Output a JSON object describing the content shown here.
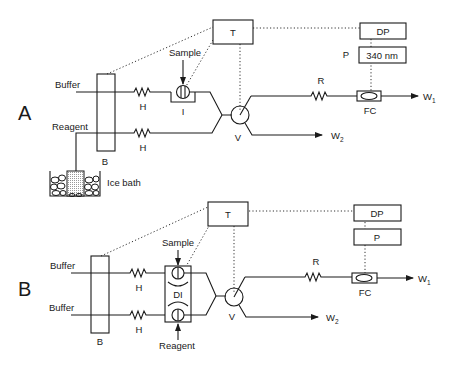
{
  "diagram": {
    "type": "flow-injection-analysis-schematic",
    "panels": [
      {
        "id": "A",
        "label": "A",
        "inputs": [
          "Buffer",
          "Reagent"
        ],
        "bath_label": "B",
        "heating_coil_label": "H",
        "injector_label": "I",
        "injection_label": "Sample",
        "cooling_label": "Ice bath",
        "controller_label": "T",
        "valve_label": "V",
        "reactor_label": "R",
        "flow_cell_label": "FC",
        "detector_label": "DP",
        "photometer_label": "P",
        "wavelength": "340 nm",
        "waste1": {
          "main": "W",
          "sub": "1"
        },
        "waste2": {
          "main": "W",
          "sub": "2"
        }
      },
      {
        "id": "B",
        "label": "B",
        "inputs": [
          "Buffer",
          "Buffer"
        ],
        "bath_label": "B",
        "heating_coil_label": "H",
        "injector_label": "DI",
        "injection_top_label": "Sample",
        "injection_bottom_label": "Reagent",
        "controller_label": "T",
        "valve_label": "V",
        "reactor_label": "R",
        "flow_cell_label": "FC",
        "detector_label": "DP",
        "photometer_label": "P",
        "waste1": {
          "main": "W",
          "sub": "1"
        },
        "waste2": {
          "main": "W",
          "sub": "2"
        }
      }
    ]
  }
}
